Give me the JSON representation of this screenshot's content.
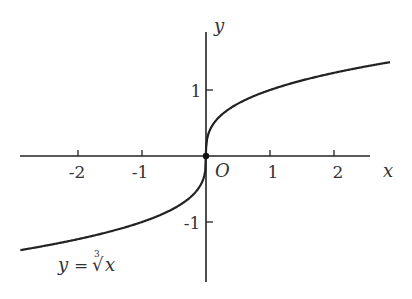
{
  "chart_data": {
    "type": "line",
    "title": "",
    "function": "y = cube root of x",
    "curve_label": "y = ∛x",
    "xlabel": "x",
    "ylabel": "y",
    "origin_label": "O",
    "x_ticks": [
      -2,
      -1,
      1,
      2
    ],
    "x_tick_labels": [
      "-2",
      "-1",
      "1",
      "2"
    ],
    "y_ticks": [
      1,
      -1
    ],
    "y_tick_labels": [
      "1",
      "-1"
    ],
    "xlim": [
      -3.0,
      2.9
    ],
    "ylim": [
      -1.9,
      2.0
    ],
    "grid": false,
    "series": [
      {
        "name": "y = ∛x",
        "x_range": [
          -2.9,
          2.875
        ]
      }
    ]
  },
  "labels": {
    "x_axis": "x",
    "y_axis": "y",
    "origin": "O",
    "tick_neg2": "-2",
    "tick_neg1": "-1",
    "tick_1": "1",
    "tick_2": "2",
    "ytick_1": "1",
    "ytick_neg1": "-1",
    "curve_y": "y",
    "curve_eq": "=",
    "curve_idx": "3",
    "curve_rad": "√",
    "curve_x": "x"
  },
  "colors": {
    "stroke": "#222222",
    "text": "#333333"
  }
}
